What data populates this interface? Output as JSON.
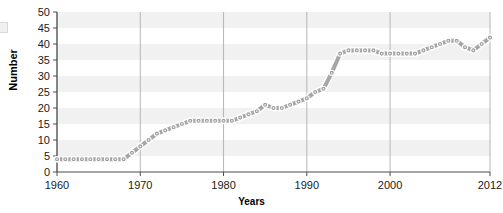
{
  "chart_data": {
    "type": "line",
    "title": "",
    "xlabel": "Years",
    "ylabel": "Number",
    "xlim": [
      1960,
      2012
    ],
    "ylim": [
      0,
      50
    ],
    "xticks": [
      1960,
      1970,
      1980,
      1990,
      2000,
      2012
    ],
    "yticks": [
      0,
      5,
      10,
      15,
      20,
      25,
      30,
      35,
      40,
      45,
      50
    ],
    "grid": "vertical gridlines at xticks; alternating horizontal shaded bands every 5 units",
    "legend": "none",
    "series": [
      {
        "name": "Number",
        "marker": "circle",
        "line_color": "#a6a6a6",
        "marker_color": "#9e9e9e",
        "x": [
          1960,
          1961,
          1962,
          1963,
          1964,
          1965,
          1966,
          1967,
          1968,
          1969,
          1970,
          1971,
          1972,
          1973,
          1974,
          1975,
          1976,
          1977,
          1978,
          1979,
          1980,
          1981,
          1982,
          1983,
          1984,
          1985,
          1986,
          1987,
          1988,
          1989,
          1990,
          1991,
          1992,
          1993,
          1994,
          1995,
          1996,
          1997,
          1998,
          1999,
          2000,
          2001,
          2002,
          2003,
          2004,
          2005,
          2006,
          2007,
          2008,
          2009,
          2010,
          2011,
          2012
        ],
        "values": [
          4,
          4,
          4,
          4,
          4,
          4,
          4,
          4,
          4,
          6,
          8,
          10,
          12,
          13,
          14,
          15,
          16,
          16,
          16,
          16,
          16,
          16,
          17,
          18,
          19,
          21,
          20,
          20,
          21,
          22,
          23,
          25,
          26,
          31,
          37,
          38,
          38,
          38,
          38,
          37,
          37,
          37,
          37,
          37,
          38,
          39,
          40,
          41,
          41,
          39,
          38,
          40,
          42
        ]
      }
    ]
  },
  "axes": {
    "ylabel_text": "Number",
    "xlabel_text": "Years"
  }
}
